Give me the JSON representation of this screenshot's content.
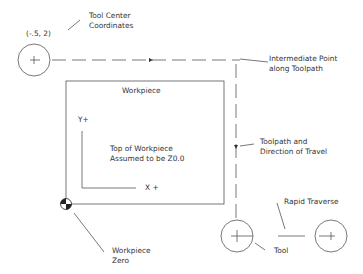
{
  "labels": {
    "start_coords": "(-.5, 2)",
    "tool_center": "Tool Center\nCoordinates",
    "intermediate_point": "Intermediate Point\nalong Toolpath",
    "workpiece": "Workpiece",
    "y_axis": "Y+",
    "x_axis": "X +",
    "top_of_workpiece": "Top of Workpiece\nAssumed to be Z0.0",
    "toolpath_direction": "Toolpath and\nDirection of Travel",
    "rapid_traverse": "Rapid Traverse",
    "tool": "Tool",
    "workpiece_zero": "Workpiece\nZero"
  },
  "colors": {
    "line": "#555555",
    "text": "#333333",
    "background": "#ffffff"
  }
}
